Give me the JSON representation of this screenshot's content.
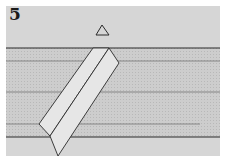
{
  "figure": {
    "panel_number": "5",
    "colors": {
      "background": "#d6d6d6",
      "strata": "#c4c4c4",
      "dike": "#e6e6e6",
      "line": "#2a2a2a"
    },
    "elements": [
      "panel-number",
      "triangle-marker",
      "surface-line",
      "strata-lines",
      "dike-block"
    ]
  }
}
